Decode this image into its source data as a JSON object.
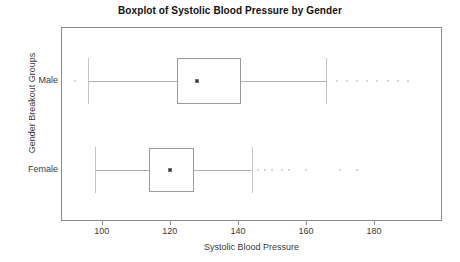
{
  "chart_data": {
    "type": "boxplot",
    "title": "Boxplot of Systolic Blood Pressure by Gender",
    "xlabel": "Systolic Blood Pressure",
    "ylabel": "Gender Breakout Groups",
    "orientation": "horizontal",
    "grid": false,
    "legend": "none",
    "xlim": [
      88,
      200
    ],
    "xticks": [
      100,
      120,
      140,
      160,
      180
    ],
    "xtick_labels": [
      "100",
      "120",
      "140",
      "160",
      "180"
    ],
    "categories": [
      "Male",
      "Female"
    ],
    "boxes": [
      {
        "label": "Male",
        "whisker_low": 96,
        "q1": 122,
        "median": 128,
        "q3": 141,
        "whisker_high": 166,
        "outliers": [
          92,
          169,
          172,
          175,
          178,
          181,
          184,
          187,
          190
        ]
      },
      {
        "label": "Female",
        "whisker_low": 98,
        "q1": 114,
        "median": 120,
        "q3": 127,
        "whisker_high": 144,
        "outliers": [
          146,
          148,
          150,
          153,
          155,
          160,
          170,
          175
        ]
      }
    ]
  },
  "axes": {
    "x_tick_labels": [
      "100",
      "120",
      "140",
      "160",
      "180"
    ],
    "y_tick_labels": [
      "Male",
      "Female"
    ]
  }
}
